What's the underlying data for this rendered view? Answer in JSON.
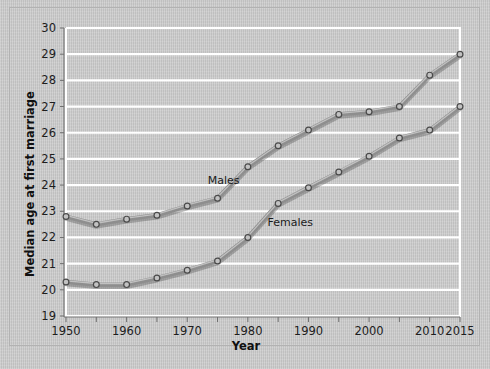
{
  "figure": {
    "background_color": "#c9c9c9",
    "frame_color": "#b2b2b2",
    "gridline_color": "#ffffff",
    "line_color": "#8e8e8e",
    "marker_fill": "#c2c2c2",
    "marker_stroke": "#4a4a4a",
    "text_color": "#1d1d1d"
  },
  "chart_data": {
    "type": "line",
    "title": "",
    "xlabel": "Year",
    "ylabel": "Median age at first marriage",
    "xlim": [
      1950,
      2015
    ],
    "ylim": [
      19,
      30
    ],
    "grid": true,
    "grid_axis": "y",
    "legend_position": "inline-annotations",
    "x_tick_labels": [
      "1950",
      "1960",
      "1970",
      "1980",
      "1990",
      "2000",
      "2010",
      "2015"
    ],
    "x_tick_values": [
      1950,
      1960,
      1970,
      1980,
      1990,
      2000,
      2010,
      2015
    ],
    "x_minor_tick_values": [
      1955,
      1965,
      1975,
      1985,
      1995,
      2005
    ],
    "y_tick_labels": [
      "19",
      "20",
      "21",
      "22",
      "23",
      "24",
      "25",
      "26",
      "27",
      "28",
      "29",
      "30"
    ],
    "y_tick_values": [
      19,
      20,
      21,
      22,
      23,
      24,
      25,
      26,
      27,
      28,
      29,
      30
    ],
    "x": [
      1950,
      1955,
      1960,
      1965,
      1970,
      1975,
      1980,
      1985,
      1990,
      1995,
      2000,
      2005,
      2010,
      2015
    ],
    "series": [
      {
        "name": "Males",
        "label": "Males",
        "label_x": 1976,
        "label_y": 24.05,
        "values": [
          22.8,
          22.5,
          22.7,
          22.85,
          23.2,
          23.5,
          24.7,
          25.5,
          26.1,
          26.7,
          26.8,
          27.0,
          28.2,
          29.0
        ]
      },
      {
        "name": "Females",
        "label": "Females",
        "label_x": 1987,
        "label_y": 22.45,
        "values": [
          20.3,
          20.2,
          20.2,
          20.45,
          20.75,
          21.1,
          22.0,
          23.3,
          23.9,
          24.5,
          25.1,
          25.8,
          26.1,
          27.0
        ]
      }
    ]
  }
}
